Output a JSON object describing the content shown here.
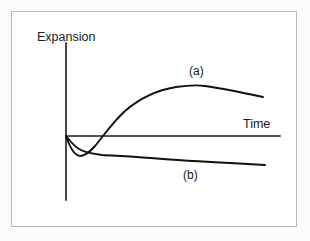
{
  "figure": {
    "background_color": "#fbfbfa",
    "frame_color": "#b9b9b9",
    "ink_color": "#111111"
  },
  "chart_data": {
    "type": "line",
    "title": "",
    "subtitle": "",
    "xlabel": "Time",
    "ylabel": "Expansion",
    "grid": false,
    "legend_position": "inline-annotation",
    "axis_style": "schematic-no-ticks",
    "xlim": [
      0,
      1
    ],
    "ylim": [
      -0.45,
      1
    ],
    "x_tick_labels": [],
    "y_tick_labels": [],
    "annotations": [
      {
        "text": "(a)",
        "x": 0.62,
        "y": 0.66,
        "series": "a"
      },
      {
        "text": "(b)",
        "x": 0.58,
        "y": -0.26,
        "series": "b"
      },
      {
        "text": "Time",
        "x": 0.84,
        "y": 0.09,
        "role": "axis-label"
      },
      {
        "text": "Expansion",
        "x": 0.0,
        "y": 0.92,
        "role": "axis-label"
      }
    ],
    "series": [
      {
        "name": "(a)",
        "label": "(a)",
        "color": "#111111",
        "description": "Initial rapid contraction to a shallow minimum, then steep sustained expansion to a broad maximum, followed by a gradual decline.",
        "x": [
          0.0,
          0.02,
          0.04,
          0.06,
          0.09,
          0.13,
          0.17,
          0.21,
          0.26,
          0.31,
          0.36,
          0.41,
          0.47,
          0.53,
          0.6,
          0.66,
          0.72,
          0.78,
          0.84,
          0.9,
          0.95,
          1.0
        ],
        "values": [
          0.0,
          -0.09,
          -0.15,
          -0.18,
          -0.18,
          -0.14,
          -0.07,
          0.02,
          0.13,
          0.25,
          0.36,
          0.45,
          0.54,
          0.61,
          0.66,
          0.69,
          0.7,
          0.69,
          0.67,
          0.64,
          0.61,
          0.58
        ],
        "crosses_zero_at_x": 0.2,
        "minimum": {
          "x": 0.07,
          "y": -0.18
        },
        "maximum": {
          "x": 0.72,
          "y": 0.7
        },
        "endpoint": {
          "x": 1.0,
          "y": 0.58
        }
      },
      {
        "name": "(b)",
        "label": "(b)",
        "color": "#111111",
        "description": "Gradual contraction to a plateau below the time axis, then a very slow continued decline with no recovery.",
        "x": [
          0.0,
          0.03,
          0.06,
          0.09,
          0.12,
          0.16,
          0.2,
          0.26,
          0.32,
          0.4,
          0.48,
          0.56,
          0.64,
          0.72,
          0.8,
          0.88,
          0.94,
          1.0
        ],
        "values": [
          0.0,
          -0.05,
          -0.09,
          -0.12,
          -0.14,
          -0.15,
          -0.155,
          -0.16,
          -0.165,
          -0.17,
          -0.175,
          -0.18,
          -0.185,
          -0.19,
          -0.2,
          -0.21,
          -0.215,
          -0.22
        ],
        "crosses_zero_at_x": 0.0,
        "minimum": {
          "x": 1.0,
          "y": -0.22
        },
        "endpoint": {
          "x": 1.0,
          "y": -0.22
        }
      }
    ]
  },
  "geometry": {
    "y_axis_x": 66,
    "y_axis_top": 43,
    "y_axis_bottom": 200,
    "x_axis_y": 136,
    "x_axis_left": 66,
    "x_axis_right": 280,
    "curve_a_path": "M 66,136 C 69,145 72,152 77,155 C 82,158 88,154 95,146 C 104,135 113,122 125,111 C 140,98 158,90 176,87 C 190,85 198,85 205,86 C 220,88 240,92 263,97",
    "curve_b_path": "M 66,136 C 70,141 74,146 79,149 C 86,153 93,154 102,155 C 118,156 140,157 163,159 C 190,161 228,163 265,165"
  }
}
